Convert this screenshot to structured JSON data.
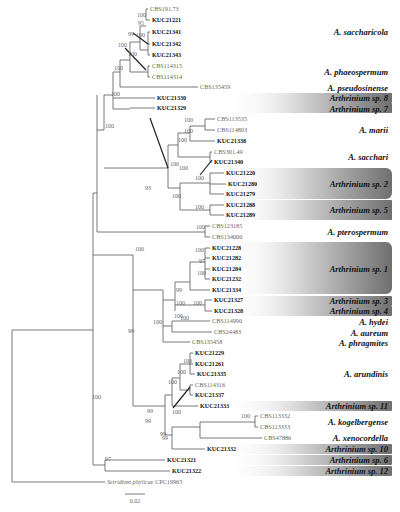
{
  "figure": {
    "type": "phylogenetic-tree",
    "scale_bar": {
      "label": "0.02",
      "x1": 125,
      "x2": 145,
      "y": 494
    }
  },
  "tips": [
    {
      "id": "CBS191.73",
      "label": "CBS191.73",
      "kuc": false,
      "x": 148,
      "y": 9
    },
    {
      "id": "KUC21221",
      "label": "KUC21221",
      "kuc": true,
      "x": 150,
      "y": 20
    },
    {
      "id": "KUC21341",
      "label": "KUC21341",
      "kuc": true,
      "x": 150,
      "y": 32
    },
    {
      "id": "KUC21342",
      "label": "KUC21342",
      "kuc": true,
      "x": 150,
      "y": 44
    },
    {
      "id": "KUC21343",
      "label": "KUC21343",
      "kuc": true,
      "x": 150,
      "y": 55
    },
    {
      "id": "CBS114315",
      "label": "CBS114315",
      "kuc": false,
      "x": 150,
      "y": 66
    },
    {
      "id": "CBS114314",
      "label": "CBS114314",
      "kuc": false,
      "x": 150,
      "y": 77
    },
    {
      "id": "CBS135459",
      "label": "CBS135459",
      "kuc": false,
      "x": 198,
      "y": 87
    },
    {
      "id": "KUC21330",
      "label": "KUC21330",
      "kuc": true,
      "x": 155,
      "y": 98
    },
    {
      "id": "KUC21329",
      "label": "KUC21329",
      "kuc": true,
      "x": 155,
      "y": 108
    },
    {
      "id": "CBS113535",
      "label": "CBS113535",
      "kuc": false,
      "x": 215,
      "y": 119
    },
    {
      "id": "CBS114803",
      "label": "CBS114803",
      "kuc": false,
      "x": 215,
      "y": 130
    },
    {
      "id": "KUC21338",
      "label": "KUC21338",
      "kuc": true,
      "x": 215,
      "y": 141
    },
    {
      "id": "CBS301.49",
      "label": "CBS301.49",
      "kuc": false,
      "x": 212,
      "y": 152
    },
    {
      "id": "KUC21340",
      "label": "KUC21340",
      "kuc": true,
      "x": 212,
      "y": 162
    },
    {
      "id": "KUC21220",
      "label": "KUC21220",
      "kuc": true,
      "x": 224,
      "y": 173
    },
    {
      "id": "KUC21280",
      "label": "KUC21280",
      "kuc": true,
      "x": 226,
      "y": 184
    },
    {
      "id": "KUC21279",
      "label": "KUC21279",
      "kuc": true,
      "x": 224,
      "y": 194
    },
    {
      "id": "KUC21288",
      "label": "KUC21288",
      "kuc": true,
      "x": 224,
      "y": 205
    },
    {
      "id": "KUC21289",
      "label": "KUC21289",
      "kuc": true,
      "x": 224,
      "y": 215
    },
    {
      "id": "CBS123185",
      "label": "CBS123185",
      "kuc": false,
      "x": 210,
      "y": 226
    },
    {
      "id": "CBS134000",
      "label": "CBS134000",
      "kuc": false,
      "x": 210,
      "y": 237
    },
    {
      "id": "KUC21228",
      "label": "KUC21228",
      "kuc": true,
      "x": 210,
      "y": 248
    },
    {
      "id": "KUC21282",
      "label": "KUC21282",
      "kuc": true,
      "x": 210,
      "y": 258
    },
    {
      "id": "KUC21284",
      "label": "KUC21284",
      "kuc": true,
      "x": 210,
      "y": 269
    },
    {
      "id": "KUC21232",
      "label": "KUC21232",
      "kuc": true,
      "x": 210,
      "y": 279
    },
    {
      "id": "KUC21334",
      "label": "KUC21334",
      "kuc": true,
      "x": 210,
      "y": 290
    },
    {
      "id": "KUC21327",
      "label": "KUC21327",
      "kuc": true,
      "x": 212,
      "y": 300
    },
    {
      "id": "KUC21328",
      "label": "KUC21328",
      "kuc": true,
      "x": 212,
      "y": 311
    },
    {
      "id": "CBS114990",
      "label": "CBS114990",
      "kuc": false,
      "x": 210,
      "y": 321
    },
    {
      "id": "CBS24483",
      "label": "CBS24483",
      "kuc": false,
      "x": 212,
      "y": 332
    },
    {
      "id": "CBS135458",
      "label": "CBS135458",
      "kuc": false,
      "x": 190,
      "y": 342
    },
    {
      "id": "KUC21229",
      "label": "KUC21229",
      "kuc": true,
      "x": 193,
      "y": 353
    },
    {
      "id": "KUC21261",
      "label": "KUC21261",
      "kuc": true,
      "x": 193,
      "y": 364
    },
    {
      "id": "KUC21335",
      "label": "KUC21335",
      "kuc": true,
      "x": 195,
      "y": 374
    },
    {
      "id": "CBS114316",
      "label": "CBS114316",
      "kuc": false,
      "x": 193,
      "y": 385
    },
    {
      "id": "KUC21337",
      "label": "KUC21337",
      "kuc": true,
      "x": 193,
      "y": 395
    },
    {
      "id": "KUC21333",
      "label": "KUC21333",
      "kuc": true,
      "x": 198,
      "y": 406
    },
    {
      "id": "CBS113332",
      "label": "CBS113332",
      "kuc": false,
      "x": 258,
      "y": 416
    },
    {
      "id": "CBS113333",
      "label": "CBS113333",
      "kuc": false,
      "x": 258,
      "y": 427
    },
    {
      "id": "CBS47886",
      "label": "CBS47886",
      "kuc": false,
      "x": 262,
      "y": 438
    },
    {
      "id": "KUC21332",
      "label": "KUC21332",
      "kuc": true,
      "x": 205,
      "y": 449
    },
    {
      "id": "KUC21321",
      "label": "KUC21321",
      "kuc": true,
      "x": 165,
      "y": 460
    },
    {
      "id": "KUC21322",
      "label": "KUC21322",
      "kuc": true,
      "x": 170,
      "y": 471
    },
    {
      "id": "Seiridium phylicae CPC19965",
      "label": "Seiridium phylicae CPC19965",
      "kuc": false,
      "x": 105,
      "y": 482
    }
  ],
  "species": [
    {
      "name": "A. saccharicola",
      "y": 32,
      "highlight": false
    },
    {
      "name": "A. phaeospermum",
      "y": 72,
      "highlight": false
    },
    {
      "name": "A. pseudosinense",
      "y": 88,
      "highlight": false
    },
    {
      "name": "Arthrinium sp. 8",
      "y": 98,
      "highlight": true,
      "y1": 93,
      "y2": 103
    },
    {
      "name": "Arthrinium sp. 7",
      "y": 109,
      "highlight": true,
      "y1": 103,
      "y2": 113
    },
    {
      "name": "A. marii",
      "y": 130,
      "highlight": false
    },
    {
      "name": "A. sacchari",
      "y": 157,
      "highlight": false
    },
    {
      "name": "Arthrinium sp. 2",
      "y": 184,
      "highlight": true,
      "y1": 168,
      "y2": 199
    },
    {
      "name": "Arthrinium sp. 5",
      "y": 210,
      "highlight": true,
      "y1": 200,
      "y2": 220
    },
    {
      "name": "A. pterospermum",
      "y": 232,
      "highlight": false
    },
    {
      "name": "Arthrinium sp. 1",
      "y": 269,
      "highlight": true,
      "y1": 242,
      "y2": 294
    },
    {
      "name": "Arthrinium sp. 3",
      "y": 301,
      "highlight": true,
      "y1": 296,
      "y2": 306
    },
    {
      "name": "Arthrinium sp. 4",
      "y": 311,
      "highlight": true,
      "y1": 306,
      "y2": 316
    },
    {
      "name": "A. hydei",
      "y": 322,
      "highlight": false
    },
    {
      "name": "A. aureum",
      "y": 333,
      "highlight": false
    },
    {
      "name": "A. phragmites",
      "y": 343,
      "highlight": false
    },
    {
      "name": "A. arundinis",
      "y": 374,
      "highlight": false
    },
    {
      "name": "Arthrinium sp. 11",
      "y": 406,
      "highlight": true,
      "y1": 401,
      "y2": 411
    },
    {
      "name": "A. kogelbergense",
      "y": 422,
      "highlight": false
    },
    {
      "name": "A. xenocordella",
      "y": 438,
      "highlight": false
    },
    {
      "name": "Arthrinium sp. 10",
      "y": 449,
      "highlight": true,
      "y1": 444,
      "y2": 454
    },
    {
      "name": "Arthrinium sp. 6",
      "y": 460,
      "highlight": true,
      "y1": 455,
      "y2": 465
    },
    {
      "name": "Arthrinium sp. 12",
      "y": 471,
      "highlight": true,
      "y1": 466,
      "y2": 476
    }
  ],
  "supports": [
    {
      "v": "100",
      "x": 137,
      "y": 17
    },
    {
      "v": "95",
      "x": 138,
      "y": 25
    },
    {
      "v": "99",
      "x": 128,
      "y": 36
    },
    {
      "v": "100",
      "x": 136,
      "y": 37
    },
    {
      "v": "100",
      "x": 118,
      "y": 47
    },
    {
      "v": "100",
      "x": 128,
      "y": 56
    },
    {
      "v": "100",
      "x": 114,
      "y": 70
    },
    {
      "v": "100",
      "x": 111,
      "y": 96
    },
    {
      "v": "100",
      "x": 105,
      "y": 128
    },
    {
      "v": "100",
      "x": 184,
      "y": 122
    },
    {
      "v": "100",
      "x": 184,
      "y": 133
    },
    {
      "v": "100",
      "x": 178,
      "y": 142
    },
    {
      "v": "100",
      "x": 170,
      "y": 166
    },
    {
      "v": "100",
      "x": 179,
      "y": 170
    },
    {
      "v": "100",
      "x": 195,
      "y": 180
    },
    {
      "v": "100",
      "x": 172,
      "y": 198
    },
    {
      "v": "100",
      "x": 195,
      "y": 209
    },
    {
      "v": "100",
      "x": 196,
      "y": 229
    },
    {
      "v": "93",
      "x": 145,
      "y": 190
    },
    {
      "v": "100",
      "x": 135,
      "y": 251
    },
    {
      "v": "100",
      "x": 195,
      "y": 252
    },
    {
      "v": "97",
      "x": 199,
      "y": 263
    },
    {
      "v": "100",
      "x": 197,
      "y": 275
    },
    {
      "v": "99",
      "x": 176,
      "y": 292
    },
    {
      "v": "100",
      "x": 176,
      "y": 305
    },
    {
      "v": "100",
      "x": 193,
      "y": 305
    },
    {
      "v": "100",
      "x": 174,
      "y": 318
    },
    {
      "v": "100",
      "x": 153,
      "y": 324
    },
    {
      "v": "100",
      "x": 180,
      "y": 320
    },
    {
      "v": "99",
      "x": 128,
      "y": 333
    },
    {
      "v": "100",
      "x": 92,
      "y": 399
    },
    {
      "v": "100",
      "x": 183,
      "y": 363
    },
    {
      "v": "100",
      "x": 177,
      "y": 374
    },
    {
      "v": "100",
      "x": 168,
      "y": 384
    },
    {
      "v": "100",
      "x": 172,
      "y": 414
    },
    {
      "v": "99",
      "x": 147,
      "y": 413
    },
    {
      "v": "99",
      "x": 145,
      "y": 423
    },
    {
      "v": "99",
      "x": 160,
      "y": 436
    },
    {
      "v": "100",
      "x": 241,
      "y": 418
    },
    {
      "v": "99",
      "x": 162,
      "y": 440
    },
    {
      "v": "97",
      "x": 105,
      "y": 461
    }
  ]
}
